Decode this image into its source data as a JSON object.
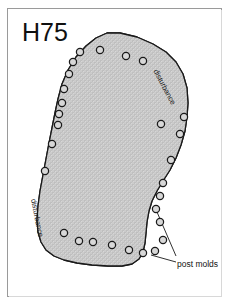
{
  "figure": {
    "title": "H75",
    "kind": "archaeological-house-plan",
    "frame": {
      "border_color": "#9a9a9a",
      "background": "#ffffff"
    },
    "floor": {
      "fill_color": "#c9c9c9",
      "outline_color": "#1a1a1a",
      "texture": "stipple",
      "outline_path": "M 107 33 L 120 33 L 137 37 L 153 44 L 166 52 L 176 62 L 183 74 L 187 88 L 188 103 L 187 117 L 185 131 L 181 145 L 176 158 L 170 170 L 163 181 L 157 191 L 152 201 L 149 211 L 147 222 L 146 233 L 145 243 L 143 252 L 139 259 L 132 264 L 122 266 L 108 266 L 92 265 L 77 263 L 64 260 L 54 256 L 46 250 L 41 242 L 38 232 L 37 220 L 38 206 L 40 191 L 43 175 L 46 159 L 49 143 L 52 128 L 55 113 L 58 99 L 62 84 L 68 70 L 76 57 L 86 46 L 96 38 Z"
    },
    "post_molds": {
      "label": "post molds",
      "symbol": "open-circle",
      "outline_color": "#1a1a1a",
      "fill_color": "#d8d8d8",
      "count": 29,
      "radius": 3.6,
      "points": [
        {
          "x": 80,
          "y": 52
        },
        {
          "x": 100,
          "y": 50
        },
        {
          "x": 126,
          "y": 56
        },
        {
          "x": 143,
          "y": 61
        },
        {
          "x": 73,
          "y": 62
        },
        {
          "x": 69,
          "y": 74
        },
        {
          "x": 64,
          "y": 89
        },
        {
          "x": 62,
          "y": 103
        },
        {
          "x": 59,
          "y": 114
        },
        {
          "x": 58,
          "y": 125
        },
        {
          "x": 52,
          "y": 144
        },
        {
          "x": 45,
          "y": 171
        },
        {
          "x": 64,
          "y": 233
        },
        {
          "x": 79,
          "y": 241
        },
        {
          "x": 93,
          "y": 242
        },
        {
          "x": 112,
          "y": 245
        },
        {
          "x": 129,
          "y": 250
        },
        {
          "x": 143,
          "y": 253
        },
        {
          "x": 155,
          "y": 251
        },
        {
          "x": 163,
          "y": 240
        },
        {
          "x": 160,
          "y": 222
        },
        {
          "x": 156,
          "y": 209
        },
        {
          "x": 160,
          "y": 196
        },
        {
          "x": 163,
          "y": 183
        },
        {
          "x": 171,
          "y": 160
        },
        {
          "x": 180,
          "y": 134
        },
        {
          "x": 161,
          "y": 124
        },
        {
          "x": 184,
          "y": 117
        }
      ],
      "leaders": [
        {
          "from_x": 176,
          "from_y": 256,
          "to_x": 157,
          "to_y": 212
        },
        {
          "from_x": 176,
          "from_y": 262,
          "to_x": 151,
          "to_y": 255
        }
      ]
    },
    "disturbance_labels": [
      {
        "id": "northeast",
        "text": "disturbance"
      },
      {
        "id": "southwest",
        "text": "disturbance"
      }
    ]
  }
}
